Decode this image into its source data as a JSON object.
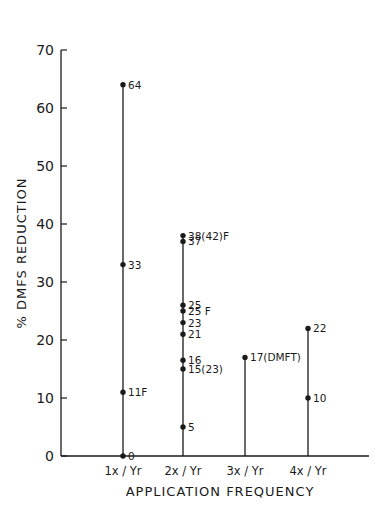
{
  "chart_data": {
    "type": "scatter",
    "subtype": "stem / dot plot",
    "title": "",
    "xlabel": "APPLICATION FREQUENCY",
    "ylabel": "% DMFS REDUCTION",
    "ylim": [
      0,
      70
    ],
    "yticks": [
      0,
      10,
      20,
      30,
      40,
      50,
      60,
      70
    ],
    "grid": false,
    "legend": null,
    "categories": [
      "1x / Yr",
      "2x / Yr",
      "3x / Yr",
      "4x / Yr"
    ],
    "series": [
      {
        "name": "1x / Yr",
        "stem_top": 64,
        "points": [
          {
            "value": 64,
            "label": "64"
          },
          {
            "value": 33,
            "label": "33"
          },
          {
            "value": 11,
            "label": "11F"
          },
          {
            "value": 0,
            "label": "0"
          }
        ]
      },
      {
        "name": "2x / Yr",
        "stem_top": 38,
        "points": [
          {
            "value": 38,
            "label": "38(42)F"
          },
          {
            "value": 37,
            "label": "37"
          },
          {
            "value": 26,
            "label": "25"
          },
          {
            "value": 25,
            "label": "25 F"
          },
          {
            "value": 23,
            "label": "23"
          },
          {
            "value": 21,
            "label": "21"
          },
          {
            "value": 16.5,
            "label": "16"
          },
          {
            "value": 15,
            "label": "15(23)"
          },
          {
            "value": 5,
            "label": "5"
          }
        ]
      },
      {
        "name": "3x / Yr",
        "stem_top": 17,
        "points": [
          {
            "value": 17,
            "label": "17(DMFT)"
          }
        ]
      },
      {
        "name": "4x / Yr",
        "stem_top": 22,
        "points": [
          {
            "value": 22,
            "label": "22"
          },
          {
            "value": 10,
            "label": "10"
          }
        ]
      }
    ],
    "annotations": [
      "F",
      "(42)",
      "(23)",
      "(DMFT)"
    ]
  },
  "colors": {
    "ink": "#1a1a1a",
    "background": "#ffffff"
  }
}
